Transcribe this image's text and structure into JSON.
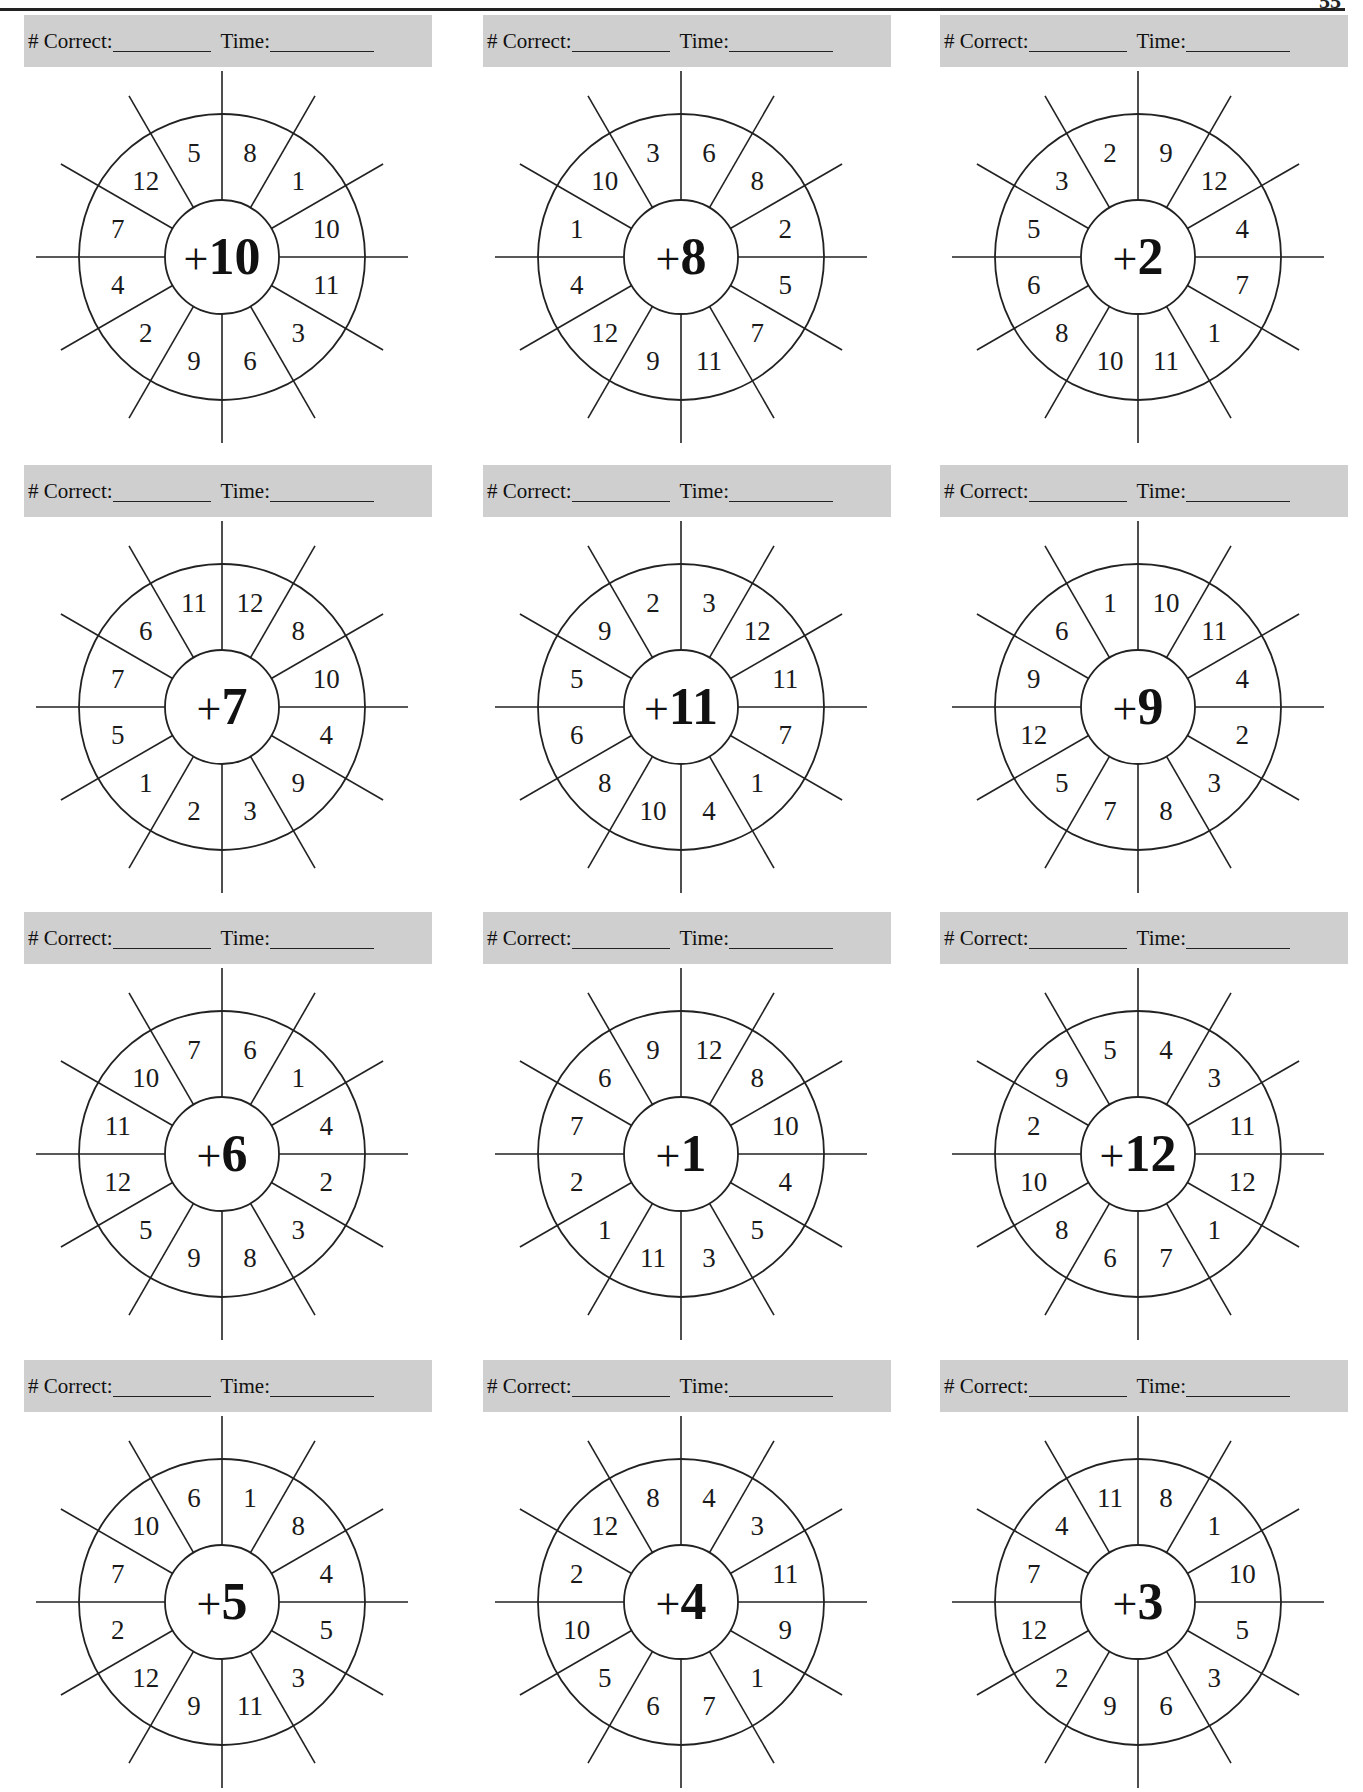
{
  "page": {
    "page_number_partial": "55"
  },
  "header_bar": {
    "correct_label": "# Correct:",
    "time_label": "Time:"
  },
  "wheels": [
    {
      "operator": "+",
      "addend": "10",
      "numbers_clockwise_from_top_right": [
        "8",
        "1",
        "10",
        "11",
        "3",
        "6",
        "9",
        "2",
        "4",
        "7",
        "12",
        "5"
      ]
    },
    {
      "operator": "+",
      "addend": "8",
      "numbers_clockwise_from_top_right": [
        "6",
        "8",
        "2",
        "5",
        "7",
        "11",
        "9",
        "12",
        "4",
        "1",
        "10",
        "3"
      ]
    },
    {
      "operator": "+",
      "addend": "2",
      "numbers_clockwise_from_top_right": [
        "9",
        "12",
        "4",
        "7",
        "1",
        "11",
        "10",
        "8",
        "6",
        "5",
        "3",
        "2"
      ]
    },
    {
      "operator": "+",
      "addend": "7",
      "numbers_clockwise_from_top_right": [
        "12",
        "8",
        "10",
        "4",
        "9",
        "3",
        "2",
        "1",
        "5",
        "7",
        "6",
        "11"
      ]
    },
    {
      "operator": "+",
      "addend": "11",
      "numbers_clockwise_from_top_right": [
        "3",
        "12",
        "11",
        "7",
        "1",
        "4",
        "10",
        "8",
        "6",
        "5",
        "9",
        "2"
      ]
    },
    {
      "operator": "+",
      "addend": "9",
      "numbers_clockwise_from_top_right": [
        "10",
        "11",
        "4",
        "2",
        "3",
        "8",
        "7",
        "5",
        "12",
        "9",
        "6",
        "1"
      ]
    },
    {
      "operator": "+",
      "addend": "6",
      "numbers_clockwise_from_top_right": [
        "6",
        "1",
        "4",
        "2",
        "3",
        "8",
        "9",
        "5",
        "12",
        "11",
        "10",
        "7"
      ]
    },
    {
      "operator": "+",
      "addend": "1",
      "numbers_clockwise_from_top_right": [
        "12",
        "8",
        "10",
        "4",
        "5",
        "3",
        "11",
        "1",
        "2",
        "7",
        "6",
        "9"
      ]
    },
    {
      "operator": "+",
      "addend": "12",
      "numbers_clockwise_from_top_right": [
        "4",
        "3",
        "11",
        "12",
        "1",
        "7",
        "6",
        "8",
        "10",
        "2",
        "9",
        "5"
      ]
    },
    {
      "operator": "+",
      "addend": "5",
      "numbers_clockwise_from_top_right": [
        "1",
        "8",
        "4",
        "5",
        "3",
        "11",
        "9",
        "12",
        "2",
        "7",
        "10",
        "6"
      ]
    },
    {
      "operator": "+",
      "addend": "4",
      "numbers_clockwise_from_top_right": [
        "4",
        "3",
        "11",
        "9",
        "1",
        "7",
        "6",
        "5",
        "10",
        "2",
        "12",
        "8"
      ]
    },
    {
      "operator": "+",
      "addend": "3",
      "numbers_clockwise_from_top_right": [
        "8",
        "1",
        "10",
        "5",
        "3",
        "6",
        "9",
        "2",
        "12",
        "7",
        "4",
        "11"
      ]
    }
  ]
}
